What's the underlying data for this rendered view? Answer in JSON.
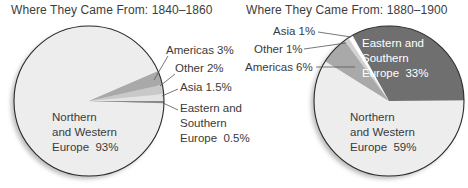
{
  "chart_data": [
    {
      "type": "pie",
      "title": "Where They Came From: 1840–1860",
      "categories": [
        "Northern and Western Europe",
        "Eastern and Southern Europe",
        "Asia",
        "Other",
        "Americas"
      ],
      "values": [
        93,
        0.5,
        1.5,
        2,
        3
      ],
      "unit": "%",
      "labels": [
        "Northern\nand Western\nEurope  93%",
        "Eastern and\nSouthern\nEurope  0.5%",
        "Asia  1.5%",
        "Other  2%",
        "Americas  3%"
      ],
      "colors": [
        "#ededed",
        "#8a8a8a",
        "#e4e4e4",
        "#c9c9c9",
        "#a9a9a9"
      ]
    },
    {
      "type": "pie",
      "title": "Where They Came From: 1880–1900",
      "categories": [
        "Eastern and Southern Europe",
        "Northern and Western Europe",
        "Americas",
        "Other",
        "Asia"
      ],
      "values": [
        33,
        59,
        6,
        1,
        1
      ],
      "unit": "%",
      "labels": [
        "Eastern and\nSouthern\nEurope  33%",
        "Northern\nand Western\nEurope  59%",
        "Americas  6%",
        "Other  1%",
        "Asia  1%"
      ],
      "colors": [
        "#6f6f6f",
        "#ededed",
        "#a9a9a9",
        "#d2d2d2",
        "#ffffff"
      ]
    }
  ],
  "left": {
    "title": "Where They Came From: 1840–1860",
    "labels": {
      "americas": "Americas  3%",
      "other": "Other  2%",
      "asia": "Asia  1.5%",
      "eastern": "Eastern and\nSouthern\nEurope  0.5%",
      "northern": "Northern\nand Western\nEurope  93%"
    }
  },
  "right": {
    "title": "Where They Came From: 1880–1900",
    "labels": {
      "asia": "Asia  1%",
      "other": "Other  1%",
      "americas": "Americas  6%",
      "eastern": "Eastern and\nSouthern\nEurope  33%",
      "northern": "Northern\nand Western\nEurope  59%"
    }
  }
}
